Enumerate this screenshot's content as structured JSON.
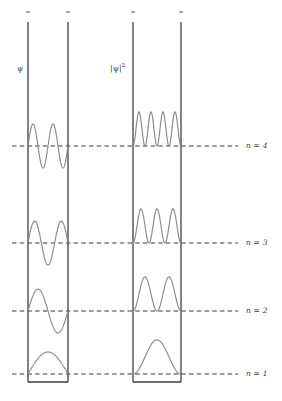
{
  "figure": {
    "title": "",
    "background_color": "#ffffff",
    "wall_color": "#3f3f3f",
    "curve_color": "#8a8a8a",
    "dash_color": "#3a3a3a",
    "text_color": "#3a3a3a"
  },
  "panels": [
    {
      "id": "psi-panel",
      "axis_label": "ψ",
      "axis_label_name": "psi-axis-label",
      "left_wall_x": 28,
      "right_wall_x": 68,
      "top_infinity": "∞",
      "curve_kind": "wavefunction"
    },
    {
      "id": "psi-squared-panel",
      "axis_label_main": "|ψ|",
      "axis_label_exponent": "2",
      "axis_label_name": "psi-squared-axis-label",
      "left_wall_x": 133,
      "right_wall_x": 181,
      "top_infinity": "∞",
      "curve_kind": "probability-density"
    }
  ],
  "infinity_markers": [
    {
      "label": "∞",
      "x": 28
    },
    {
      "label": "∞",
      "x": 68
    },
    {
      "label": "∞",
      "x": 133
    },
    {
      "label": "∞",
      "x": 181
    }
  ],
  "levels": [
    {
      "label": "n = 4",
      "n": 4,
      "baseline_y": 146,
      "amplitude": 22,
      "nodes": 4
    },
    {
      "label": "n = 3",
      "n": 3,
      "baseline_y": 243,
      "amplitude": 22,
      "nodes": 3
    },
    {
      "label": "n = 2",
      "n": 2,
      "baseline_y": 311,
      "amplitude": 22,
      "nodes": 2
    },
    {
      "label": "n = 1",
      "n": 1,
      "baseline_y": 374,
      "amplitude": 22,
      "nodes": 1
    }
  ],
  "chart_data": {
    "type": "line",
    "xlabel": "",
    "ylabel": "",
    "grid": false,
    "legend": "none",
    "annotations": [
      "∞",
      "∞",
      "∞",
      "∞",
      "ψ",
      "|ψ|²"
    ],
    "level_labels": [
      "n = 4",
      "n = 3",
      "n = 2",
      "n = 1"
    ],
    "series": [
      {
        "name": "psi n=1",
        "panel": "psi",
        "n": 1,
        "half_waves": 1,
        "nodes_interior": 0,
        "formula": "sin(1*pi*x/L)"
      },
      {
        "name": "psi n=2",
        "panel": "psi",
        "n": 2,
        "half_waves": 2,
        "nodes_interior": 1,
        "formula": "sin(2*pi*x/L)"
      },
      {
        "name": "psi n=3",
        "panel": "psi",
        "n": 3,
        "half_waves": 3,
        "nodes_interior": 2,
        "formula": "sin(3*pi*x/L)"
      },
      {
        "name": "psi n=4",
        "panel": "psi",
        "n": 4,
        "half_waves": 4,
        "nodes_interior": 3,
        "formula": "sin(4*pi*x/L)"
      },
      {
        "name": "psi2 n=1",
        "panel": "psi_squared",
        "n": 1,
        "peaks": 1,
        "formula": "sin(1*pi*x/L)^2"
      },
      {
        "name": "psi2 n=2",
        "panel": "psi_squared",
        "n": 2,
        "peaks": 2,
        "formula": "sin(2*pi*x/L)^2"
      },
      {
        "name": "psi2 n=3",
        "panel": "psi_squared",
        "n": 3,
        "peaks": 3,
        "formula": "sin(3*pi*x/L)^2"
      },
      {
        "name": "psi2 n=4",
        "panel": "psi_squared",
        "n": 4,
        "peaks": 4,
        "formula": "sin(4*pi*x/L)^2"
      }
    ],
    "axis_ranges": {
      "x": [
        0,
        1
      ],
      "y": [
        -1,
        1
      ]
    }
  },
  "geometry": {
    "box_top_y": 22,
    "box_bottom_y": 382,
    "dash_start_x": 12,
    "dash_end_x": 238,
    "label_x": 246
  }
}
